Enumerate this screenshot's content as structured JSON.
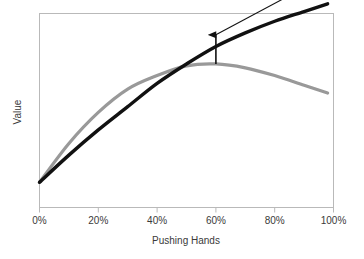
{
  "chart_data": {
    "type": "line",
    "title": "",
    "subtitle": "",
    "xlabel": "Pushing Hands",
    "ylabel": "Value",
    "xlim": [
      0,
      100
    ],
    "ylim": [
      0,
      100
    ],
    "grid": false,
    "legend": "none",
    "xticklabels": [
      "0%",
      "20%",
      "40%",
      "60%",
      "80%",
      "100%"
    ],
    "xtickvalues": [
      0,
      20,
      40,
      60,
      80,
      100
    ],
    "yticklabels": [],
    "x": [
      0,
      10,
      20,
      30,
      40,
      50,
      60,
      70,
      80,
      90,
      98
    ],
    "series": [
      {
        "name": "gray-curve",
        "color": "#999999",
        "width": 3.2,
        "values": [
          13,
          33,
          49,
          61,
          68,
          73,
          74,
          72,
          68,
          63,
          59
        ]
      },
      {
        "name": "black-curve",
        "color": "#111111",
        "width": 3.4,
        "values": [
          13,
          27,
          40,
          52,
          64,
          74,
          83,
          90,
          96,
          101,
          105
        ]
      }
    ],
    "annotations": [
      {
        "name": "gap-arrow-vertical",
        "kind": "arrow",
        "x": 60,
        "y_from": 74,
        "y_to": 89,
        "color": "#111111"
      },
      {
        "name": "trend-arrow-diagonal",
        "kind": "arrow",
        "x_from": 60,
        "y_from": 89,
        "x_to": 97,
        "y_to": 119,
        "color": "#111111"
      }
    ],
    "frame": {
      "color": "#b9b9b9",
      "left": true,
      "bottom": true,
      "top": true,
      "right": true
    }
  }
}
